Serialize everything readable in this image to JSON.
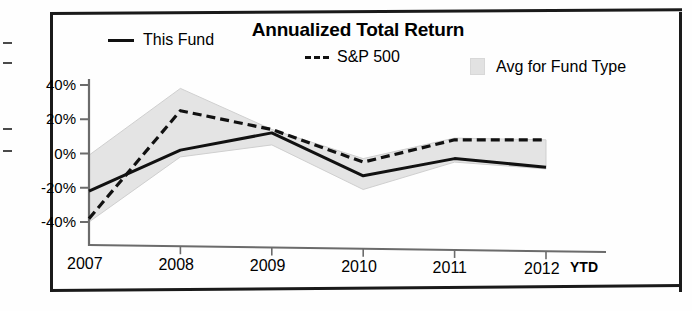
{
  "chart_title": "Annualized Total Return",
  "legend": [
    {
      "key": "this_fund",
      "label": "This Fund",
      "style": "solid-line",
      "icon": "solid-line-swatch"
    },
    {
      "key": "sp500",
      "label": "S&P 500",
      "style": "dashed-line",
      "icon": "dashed-line-swatch"
    },
    {
      "key": "avg_fund_type",
      "label": "Avg for Fund Type",
      "style": "shaded-band",
      "icon": "shaded-band-swatch"
    }
  ],
  "axes": {
    "y_ticks": [
      "40%",
      "20%",
      "0%",
      "-20%",
      "-40%"
    ],
    "x_ticks": [
      "2007",
      "2008",
      "2009",
      "2010",
      "2011",
      "2012"
    ],
    "x_suffix": "YTD"
  },
  "colors": {
    "line": "#111111",
    "band": "#e4e4e4",
    "band_edge": "#cfcfcf",
    "axis": "#6b6b6b",
    "frame": "#1a1a1a"
  },
  "chart_data": {
    "type": "line",
    "title": "Annualized Total Return",
    "xlabel": "",
    "ylabel": "",
    "categories": [
      "2007",
      "2008",
      "2009",
      "2010",
      "2011",
      "2012 YTD"
    ],
    "ylim": [
      -40,
      40
    ],
    "ytick_values": [
      40,
      20,
      0,
      -20,
      -40
    ],
    "grid": false,
    "legend_position": "top",
    "series": [
      {
        "name": "This Fund",
        "style": "solid",
        "values": [
          -22,
          2,
          12,
          -13,
          -3,
          -8
        ]
      },
      {
        "name": "S&P 500",
        "style": "dashed",
        "values": [
          -38,
          25,
          14,
          -5,
          8,
          8
        ]
      },
      {
        "name": "Avg for Fund Type (upper)",
        "style": "band-upper",
        "values": [
          -1,
          38,
          14,
          -3,
          9,
          8
        ]
      },
      {
        "name": "Avg for Fund Type (lower)",
        "style": "band-lower",
        "values": [
          -40,
          -2,
          5,
          -21,
          -5,
          -9
        ]
      }
    ]
  }
}
